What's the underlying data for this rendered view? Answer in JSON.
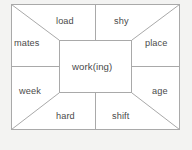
{
  "diagram": {
    "type": "word-web",
    "title": "",
    "center": {
      "label": "work(ing)"
    },
    "line_color": "#a9a9a9",
    "text_color": "#4a4a4a",
    "background_color": "#ffffff",
    "page_background_color": "#f3f3f2",
    "cells": [
      {
        "id": "top-left",
        "label": "load",
        "position": "top-left"
      },
      {
        "id": "top-right",
        "label": "shy",
        "position": "top-right"
      },
      {
        "id": "left-top",
        "label": "mates",
        "position": "left-top"
      },
      {
        "id": "right-top",
        "label": "place",
        "position": "right-top"
      },
      {
        "id": "left-bottom",
        "label": "week",
        "position": "left-bottom"
      },
      {
        "id": "right-bottom",
        "label": "age",
        "position": "right-bottom"
      },
      {
        "id": "bottom-left",
        "label": "hard",
        "position": "bottom-left"
      },
      {
        "id": "bottom-right",
        "label": "shift",
        "position": "bottom-right"
      }
    ],
    "geometry": {
      "outer": {
        "x1": 11,
        "y1": 4,
        "x2": 180,
        "y2": 130
      },
      "inner": {
        "x1": 59,
        "y1": 40,
        "x2": 132,
        "y2": 93
      },
      "vertical_divider_x": 95,
      "horizontal_divider_y": 66
    }
  }
}
